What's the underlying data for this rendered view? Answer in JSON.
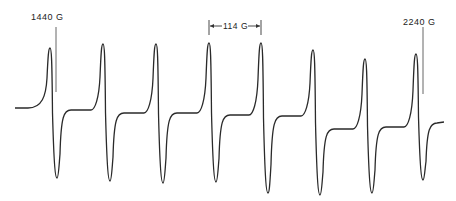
{
  "chart_data": {
    "type": "line",
    "title": "",
    "xlabel": "Magnetic field (G)",
    "ylabel": "",
    "x_range_gauss": [
      1440,
      2240
    ],
    "line_spacing_label": "114 G",
    "annotations": [
      {
        "text": "1440 G",
        "marker_x_px": 56
      },
      {
        "text": "114 G",
        "span_px": [
          209,
          261
        ]
      },
      {
        "text": "2240 G",
        "marker_x_px": 423
      }
    ],
    "lines": [
      {
        "index": 1,
        "peak_x": 50,
        "peak_y": 48,
        "trough_x": 57,
        "trough_y": 178
      },
      {
        "index": 2,
        "peak_x": 103,
        "peak_y": 44,
        "trough_x": 110,
        "trough_y": 181
      },
      {
        "index": 3,
        "peak_x": 156,
        "peak_y": 44,
        "trough_x": 163,
        "trough_y": 183
      },
      {
        "index": 4,
        "peak_x": 209,
        "peak_y": 43,
        "trough_x": 216,
        "trough_y": 182
      },
      {
        "index": 5,
        "peak_x": 261,
        "peak_y": 43,
        "trough_x": 268,
        "trough_y": 193
      },
      {
        "index": 6,
        "peak_x": 313,
        "peak_y": 50,
        "trough_x": 320,
        "trough_y": 195
      },
      {
        "index": 7,
        "peak_x": 365,
        "peak_y": 59,
        "trough_x": 372,
        "trough_y": 193
      },
      {
        "index": 8,
        "peak_x": 416,
        "peak_y": 54,
        "trough_x": 423,
        "trough_y": 180
      }
    ],
    "baseline_y": [
      108,
      110,
      113,
      113,
      115,
      116,
      129,
      127,
      123
    ],
    "grid": false,
    "legend": false
  },
  "labels": {
    "left_marker": "1440 G",
    "spacing": "114 G",
    "right_marker": "2240 G"
  },
  "colors": {
    "trace": "#2a2a2a",
    "background": "#ffffff"
  }
}
